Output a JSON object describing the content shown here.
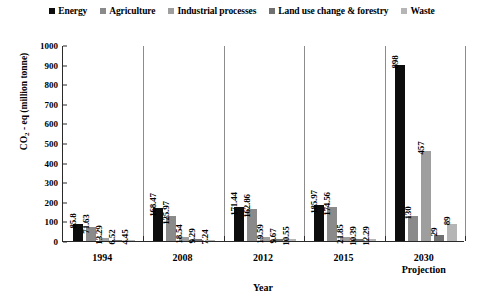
{
  "chart_data": {
    "type": "bar",
    "title": "",
    "xlabel": "Year",
    "ylabel": "CO2 - eq (million tonne)",
    "ylabel_prefix": "CO",
    "ylabel_sub": "2",
    "ylabel_suffix": " - eq (million tonne)",
    "ylim": [
      0,
      1000
    ],
    "ytick_step": 100,
    "yticks": [
      "1000",
      "900",
      "800",
      "700",
      "600",
      "500",
      "400",
      "300",
      "200",
      "100",
      "0"
    ],
    "grid": false,
    "legend_position": "top-center",
    "categories": [
      "1994",
      "2008",
      "2012",
      "2015",
      "2030 Projection"
    ],
    "category_lines": [
      [
        "1994"
      ],
      [
        "2008"
      ],
      [
        "2012"
      ],
      [
        "2015"
      ],
      [
        "2030",
        "Projection"
      ]
    ],
    "series": [
      {
        "name": "Energy",
        "color": "#0d0d0d",
        "values": [
          85.8,
          168.47,
          171.44,
          185.97,
          898
        ]
      },
      {
        "name": "Agriculture",
        "color": "#8a8a8a",
        "values": [
          71.63,
          125.97,
          162.86,
          174.56,
          130
        ]
      },
      {
        "name": "Industrial processes",
        "color": "#9e9e9e",
        "values": [
          13.29,
          18.54,
          19.59,
          21.85,
          457
        ]
      },
      {
        "name": "Land use change & forestry",
        "color": "#707070",
        "values": [
          6.52,
          9.29,
          9.67,
          10.39,
          29
        ]
      },
      {
        "name": "Waste",
        "color": "#b5b5b5",
        "values": [
          4.45,
          7.24,
          10.55,
          12.29,
          89
        ]
      }
    ],
    "value_labels": [
      [
        "85.8",
        "71.63",
        "13.29",
        "6.52",
        "4.45"
      ],
      [
        "168.47",
        "125.97",
        "18.54",
        "9.29",
        "7.24"
      ],
      [
        "171.44",
        "162.86",
        "19.59",
        "9.67",
        "10.55"
      ],
      [
        "185.97",
        "174.56",
        "21.85",
        "10.39",
        "12.29"
      ],
      [
        "898",
        "130",
        "457",
        "29",
        "89"
      ]
    ]
  },
  "legend": {
    "items": [
      {
        "label": "Energy",
        "color": "#0d0d0d"
      },
      {
        "label": "Agriculture",
        "color": "#8a8a8a"
      },
      {
        "label": "Industrial processes",
        "color": "#9e9e9e"
      },
      {
        "label": "Land use change & forestry",
        "color": "#707070"
      },
      {
        "label": "Waste",
        "color": "#b5b5b5"
      }
    ]
  },
  "axes": {
    "y_title_text": "CO2 - eq (million tonne)",
    "x_title_text": "Year"
  }
}
